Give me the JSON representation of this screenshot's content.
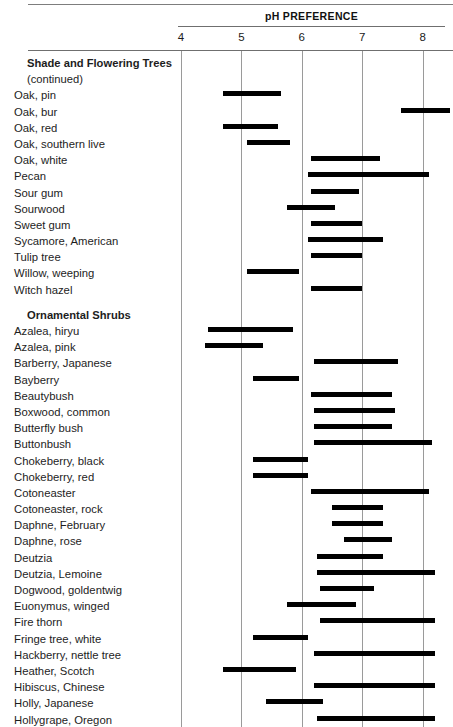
{
  "chart_data": {
    "type": "bar",
    "orientation": "horizontal-range",
    "title": "pH PREFERENCE",
    "xlabel": "",
    "ylabel": "",
    "xlim": [
      3.6,
      8.6
    ],
    "ticks": [
      4,
      5,
      6,
      7,
      8
    ],
    "tick_labels": [
      "4",
      "5",
      "6",
      "7",
      "8"
    ],
    "grid": true,
    "legend": null,
    "sections": [
      {
        "heading": "Shade and Flowering Trees",
        "subheading": "(continued)",
        "rows": [
          {
            "label": "Oak, pin",
            "low": 4.7,
            "high": 5.65
          },
          {
            "label": "Oak, bur",
            "low": 7.65,
            "high": 8.45
          },
          {
            "label": "Oak, red",
            "low": 4.7,
            "high": 5.6
          },
          {
            "label": "Oak, southern live",
            "low": 5.1,
            "high": 5.8
          },
          {
            "label": "Oak, white",
            "low": 6.15,
            "high": 7.3
          },
          {
            "label": "Pecan",
            "low": 6.1,
            "high": 8.1
          },
          {
            "label": "Sour gum",
            "low": 6.15,
            "high": 6.95
          },
          {
            "label": "Sourwood",
            "low": 5.75,
            "high": 6.55
          },
          {
            "label": "Sweet gum",
            "low": 6.15,
            "high": 7.0
          },
          {
            "label": "Sycamore, American",
            "low": 6.1,
            "high": 7.35
          },
          {
            "label": "Tulip tree",
            "low": 6.15,
            "high": 7.0
          },
          {
            "label": "Willow, weeping",
            "low": 5.1,
            "high": 5.95
          },
          {
            "label": "Witch hazel",
            "low": 6.15,
            "high": 7.0
          }
        ]
      },
      {
        "heading": "Ornamental Shrubs",
        "subheading": "",
        "rows": [
          {
            "label": "Azalea, hiryu",
            "low": 4.45,
            "high": 5.85
          },
          {
            "label": "Azalea, pink",
            "low": 4.4,
            "high": 5.35
          },
          {
            "label": "Barberry, Japanese",
            "low": 6.2,
            "high": 7.6
          },
          {
            "label": "Bayberry",
            "low": 5.2,
            "high": 5.95
          },
          {
            "label": "Beautybush",
            "low": 6.15,
            "high": 7.5
          },
          {
            "label": "Boxwood, common",
            "low": 6.2,
            "high": 7.55
          },
          {
            "label": "Butterfly bush",
            "low": 6.2,
            "high": 7.5
          },
          {
            "label": "Buttonbush",
            "low": 6.2,
            "high": 8.15
          },
          {
            "label": "Chokeberry, black",
            "low": 5.2,
            "high": 6.1
          },
          {
            "label": "Chokeberry, red",
            "low": 5.2,
            "high": 6.1
          },
          {
            "label": "Cotoneaster",
            "low": 6.15,
            "high": 8.1
          },
          {
            "label": "Cotoneaster, rock",
            "low": 6.5,
            "high": 7.35
          },
          {
            "label": "Daphne, February",
            "low": 6.5,
            "high": 7.35
          },
          {
            "label": "Daphne, rose",
            "low": 6.7,
            "high": 7.5
          },
          {
            "label": "Deutzia",
            "low": 6.25,
            "high": 7.35
          },
          {
            "label": "Deutzia, Lemoine",
            "low": 6.25,
            "high": 8.2
          },
          {
            "label": "Dogwood, goldentwig",
            "low": 6.3,
            "high": 7.2
          },
          {
            "label": "Euonymus, winged",
            "low": 5.75,
            "high": 6.9
          },
          {
            "label": "Fire thorn",
            "low": 6.3,
            "high": 8.2
          },
          {
            "label": "Fringe tree, white",
            "low": 5.2,
            "high": 6.1
          },
          {
            "label": "Hackberry, nettle tree",
            "low": 6.2,
            "high": 8.2
          },
          {
            "label": "Heather, Scotch",
            "low": 4.7,
            "high": 5.9
          },
          {
            "label": "Hibiscus, Chinese",
            "low": 6.2,
            "high": 8.2
          },
          {
            "label": "Holly, Japanese",
            "low": 5.4,
            "high": 6.35
          },
          {
            "label": "Hollygrape, Oregon",
            "low": 6.25,
            "high": 8.2
          }
        ]
      }
    ]
  }
}
